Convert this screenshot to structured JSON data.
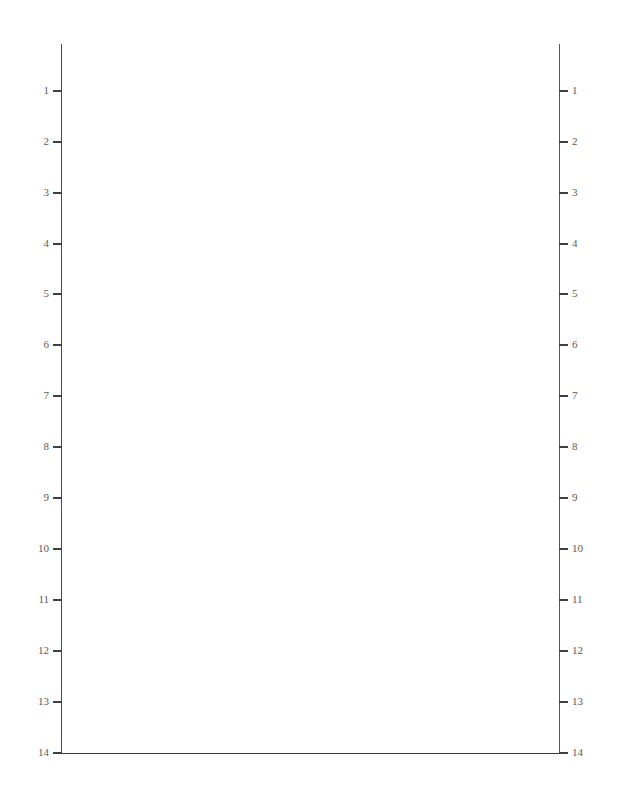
{
  "chart_data": {
    "type": "table",
    "title": "",
    "subtitle": "",
    "xlabel": "",
    "ylabel": "",
    "legend": [],
    "annotations": [],
    "series": [],
    "values": [],
    "grid": true,
    "grid_style": {
      "horizontal_lines": 14,
      "vertical_lines": 4,
      "horizontal_color": "#f0f0f0",
      "vertical_color": "#c9c9c9"
    },
    "axis": {
      "left_tick_labels": [
        "1",
        "2",
        "3",
        "4",
        "5",
        "6",
        "7",
        "8",
        "9",
        "10",
        "11",
        "12",
        "13",
        "14"
      ],
      "right_tick_labels": [
        "1",
        "2",
        "3",
        "4",
        "5",
        "6",
        "7",
        "8",
        "9",
        "10",
        "11",
        "12",
        "13",
        "14"
      ],
      "bottom_tick_labels": [],
      "top_tick_labels": [],
      "ylim": [
        1,
        14
      ],
      "y_direction": "downward",
      "frame_color": "#3a3a3a",
      "label_color": "#5b5b5b"
    },
    "row_positions_px": [
      91,
      142,
      193,
      244,
      294,
      345,
      396,
      447,
      498,
      549,
      600,
      651,
      702,
      753
    ],
    "column_positions_px": [
      62,
      160,
      260,
      355,
      455,
      559
    ]
  },
  "ticks": [
    {
      "label": "1",
      "y": 91
    },
    {
      "label": "2",
      "y": 142
    },
    {
      "label": "3",
      "y": 193
    },
    {
      "label": "4",
      "y": 244
    },
    {
      "label": "5",
      "y": 294
    },
    {
      "label": "6",
      "y": 345
    },
    {
      "label": "7",
      "y": 396
    },
    {
      "label": "8",
      "y": 447
    },
    {
      "label": "9",
      "y": 498
    },
    {
      "label": "10",
      "y": 549
    },
    {
      "label": "11",
      "y": 600
    },
    {
      "label": "12",
      "y": 651
    },
    {
      "label": "13",
      "y": 702
    },
    {
      "label": "14",
      "y": 753
    }
  ],
  "vertical_gridlines": [
    {
      "x": 160
    },
    {
      "x": 260
    },
    {
      "x": 355
    },
    {
      "x": 455
    }
  ],
  "page": {
    "width": 617,
    "height": 806,
    "background": "#ffffff"
  }
}
